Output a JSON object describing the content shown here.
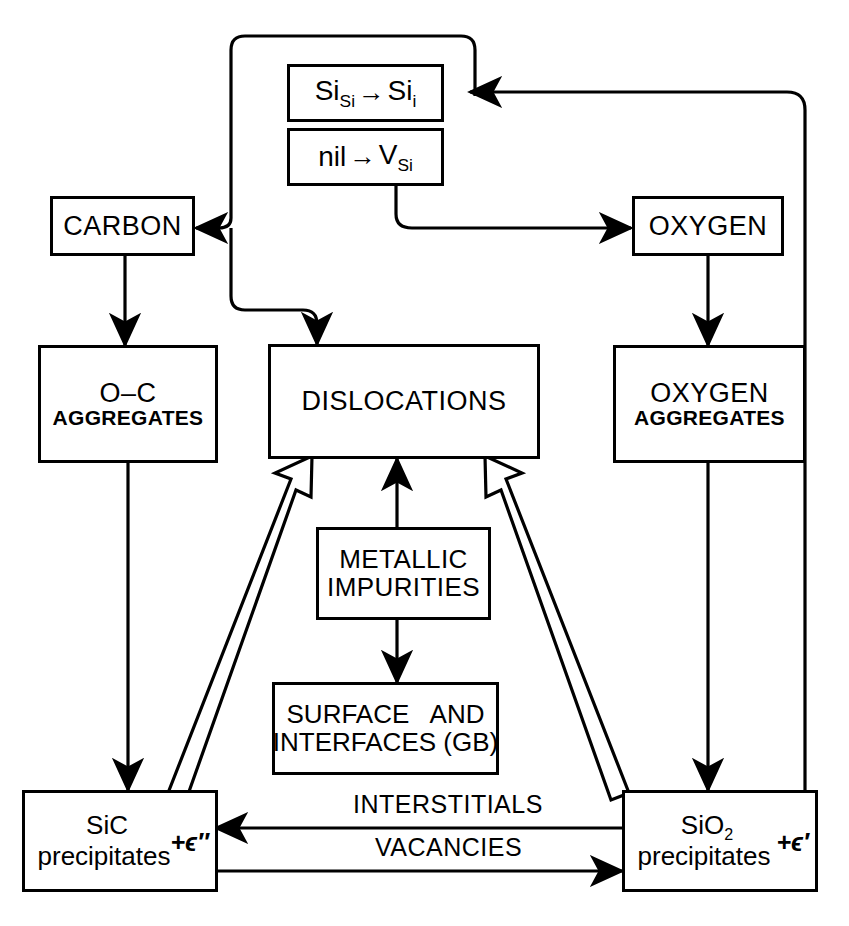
{
  "diagram": {
    "colors": {
      "stroke": "#000000",
      "fill": "#ffffff"
    },
    "nodes": {
      "si_self": {
        "name": "self-interstitial-reaction",
        "lhs": "Si",
        "lhs_sub": "Si",
        "arrow": "→",
        "rhs": "Si",
        "rhs_sub": "i"
      },
      "vacancy": {
        "name": "vacancy-reaction",
        "lhs": "nil",
        "arrow": "→",
        "rhs": "V",
        "rhs_sub": "Si"
      },
      "carbon": {
        "label": "CARBON"
      },
      "oxygen": {
        "label": "OXYGEN"
      },
      "oc_aggregates": {
        "line1": "O–C",
        "line2": "AGGREGATES"
      },
      "dislocations": {
        "label": "DISLOCATIONS"
      },
      "oxygen_aggregates": {
        "line1": "OXYGEN",
        "line2": "AGGREGATES"
      },
      "metallic_impurities": {
        "line1": "METALLIC",
        "line2": "IMPURITIES"
      },
      "surface_interfaces": {
        "line1": "SURFACE   AND",
        "line2": "INTERFACES (GB)"
      },
      "sic": {
        "line1": "SiC",
        "line2": "precipitates",
        "strain": "+ϵ″"
      },
      "sio2": {
        "line1": "SiO",
        "line1_sub": "2",
        "line2": "precipitates",
        "strain": "+ϵ′"
      }
    },
    "edge_labels": {
      "interstitials": "INTERSTITIALS",
      "vacancies": "VACANCIES"
    }
  }
}
